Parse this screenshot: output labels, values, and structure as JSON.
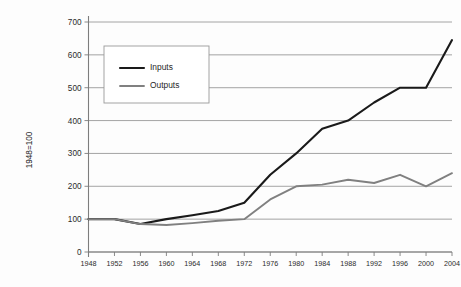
{
  "chart_data": {
    "type": "line",
    "title": "",
    "xlabel": "",
    "ylabel": "1948=100",
    "xlim": [
      1948,
      2004
    ],
    "ylim": [
      0,
      700
    ],
    "ytick_step": 100,
    "xtick_step": 4,
    "grid": true,
    "legend_position": "upper-left-inside",
    "categories": [
      1948,
      1952,
      1956,
      1960,
      1964,
      1968,
      1972,
      1976,
      1980,
      1984,
      1988,
      1992,
      1996,
      2000,
      2004
    ],
    "yticks": [
      0,
      100,
      200,
      300,
      400,
      500,
      600,
      700
    ],
    "xticks": [
      1948,
      1952,
      1956,
      1960,
      1964,
      1968,
      1972,
      1976,
      1980,
      1984,
      1988,
      1992,
      1996,
      2000,
      2004
    ],
    "series": [
      {
        "name": "Inputs",
        "color": "#1a1a1a",
        "width": 2.1,
        "values": [
          100,
          100,
          85,
          100,
          112,
          125,
          150,
          235,
          300,
          375,
          400,
          455,
          500,
          500,
          645
        ]
      },
      {
        "name": "Outputs",
        "color": "#808080",
        "width": 1.9,
        "values": [
          100,
          100,
          85,
          82,
          88,
          95,
          100,
          160,
          200,
          205,
          220,
          210,
          235,
          200,
          240
        ]
      }
    ]
  },
  "legend": {
    "entries": [
      {
        "label": "Inputs"
      },
      {
        "label": "Outputs"
      }
    ]
  },
  "axes": {
    "y_title": "1948=100"
  },
  "colors": {
    "inputs": "#1a1a1a",
    "outputs": "#808080",
    "gridline": "#9a9a9a",
    "axis": "#7d7d7d",
    "background": "#fdfdfd"
  }
}
